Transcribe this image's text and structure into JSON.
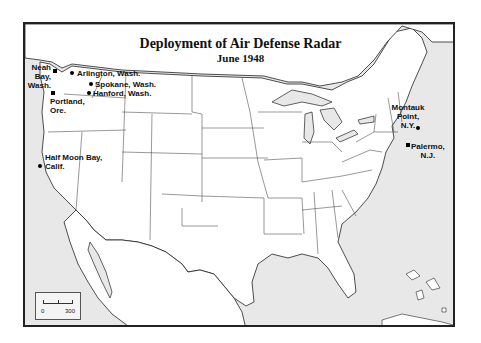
{
  "map": {
    "title": "Deployment of Air Defense Radar",
    "subtitle": "June 1948",
    "colors": {
      "land": "#ffffff",
      "water": "#e8e8e8",
      "border": "#222222",
      "marker": "#000000"
    },
    "sites": [
      {
        "name": "Neah Bay, Wash.",
        "label_lines": [
          "Neah",
          "Bay,",
          "Wash."
        ]
      },
      {
        "name": "Arlington, Wash.",
        "label": "Arlington, Wash."
      },
      {
        "name": "Spokane, Wash.",
        "label": "Spokane, Wash."
      },
      {
        "name": "Hanford, Wash.",
        "label": "Hanford, Wash."
      },
      {
        "name": "Portland, Ore.",
        "label_lines": [
          "Portland,",
          "Ore."
        ]
      },
      {
        "name": "Half Moon Bay, Calif.",
        "label_lines": [
          "Half Moon Bay,",
          "Calif."
        ]
      },
      {
        "name": "Montauk Point, N.Y.",
        "label_lines": [
          "Montauk",
          "Point,",
          "N.Y."
        ]
      },
      {
        "name": "Palermo, N.J.",
        "label_lines": [
          "Palermo,",
          "N.J."
        ]
      }
    ],
    "scale_bar": {
      "start": "0",
      "end": "300"
    }
  }
}
